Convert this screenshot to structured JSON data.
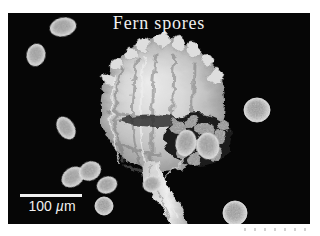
{
  "figure": {
    "title": "Fern spores",
    "scale_bar": {
      "value": "100",
      "mu": "µ",
      "meter": "m"
    }
  },
  "image_content": {
    "main_subject": "large wrinkled sporangium with twisted stalk and dark spore mass",
    "spores": [
      {
        "cx": 55,
        "cy": 14,
        "rx": 13,
        "ry": 9,
        "rot": -12
      },
      {
        "cx": 28,
        "cy": 42,
        "rx": 9,
        "ry": 11,
        "rot": 12
      },
      {
        "cx": 58,
        "cy": 115,
        "rx": 8,
        "ry": 12,
        "rot": -32
      },
      {
        "cx": 65,
        "cy": 164,
        "rx": 12,
        "ry": 9,
        "rot": -35
      },
      {
        "cx": 82,
        "cy": 158,
        "rx": 11,
        "ry": 9,
        "rot": -25
      },
      {
        "cx": 99,
        "cy": 172,
        "rx": 10,
        "ry": 8,
        "rot": -20
      },
      {
        "cx": 96,
        "cy": 193,
        "rx": 9,
        "ry": 9,
        "rot": 0
      },
      {
        "cx": 144,
        "cy": 171,
        "rx": 9,
        "ry": 8,
        "rot": -15
      },
      {
        "cx": 178,
        "cy": 130,
        "rx": 10,
        "ry": 13,
        "rot": 12
      },
      {
        "cx": 200,
        "cy": 133,
        "rx": 11,
        "ry": 13,
        "rot": -8
      },
      {
        "cx": 249,
        "cy": 97,
        "rx": 13,
        "ry": 12,
        "rot": 0
      },
      {
        "cx": 227,
        "cy": 200,
        "rx": 12,
        "ry": 12,
        "rot": 0
      }
    ]
  },
  "colors": {
    "page_background": "#ffffff",
    "sem_background": "#060606",
    "title_text": "#f0f0f0",
    "scale_bar": "#f0f0f0",
    "spore_rim": "#e8e8e8",
    "spore_body": "#a6a6a6"
  }
}
